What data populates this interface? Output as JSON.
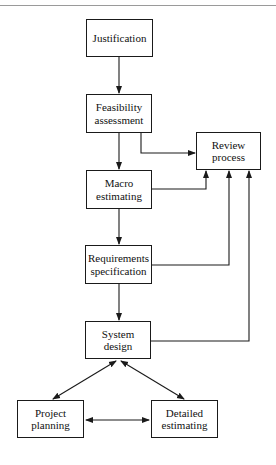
{
  "diagram": {
    "type": "flowchart",
    "nodes": [
      {
        "id": "justification",
        "lines": [
          "Justification"
        ]
      },
      {
        "id": "feasibility",
        "lines": [
          "Feasibility",
          "assessment"
        ]
      },
      {
        "id": "review",
        "lines": [
          "Review",
          "process"
        ]
      },
      {
        "id": "macro",
        "lines": [
          "Macro",
          "estimating"
        ]
      },
      {
        "id": "requirements",
        "lines": [
          "Requirements",
          "specification"
        ]
      },
      {
        "id": "system",
        "lines": [
          "System",
          "design"
        ]
      },
      {
        "id": "project",
        "lines": [
          "Project",
          "planning"
        ]
      },
      {
        "id": "detailed",
        "lines": [
          "Detailed",
          "estimating"
        ]
      }
    ],
    "edges": [
      {
        "from": "justification",
        "to": "feasibility",
        "direction": "forward"
      },
      {
        "from": "feasibility",
        "to": "macro",
        "direction": "forward"
      },
      {
        "from": "feasibility",
        "to": "review",
        "direction": "forward"
      },
      {
        "from": "macro",
        "to": "requirements",
        "direction": "forward"
      },
      {
        "from": "macro",
        "to": "review",
        "direction": "forward"
      },
      {
        "from": "requirements",
        "to": "system",
        "direction": "forward"
      },
      {
        "from": "requirements",
        "to": "review",
        "direction": "forward"
      },
      {
        "from": "system",
        "to": "review",
        "direction": "forward"
      },
      {
        "from": "system",
        "to": "project",
        "direction": "both"
      },
      {
        "from": "system",
        "to": "detailed",
        "direction": "both"
      },
      {
        "from": "project",
        "to": "detailed",
        "direction": "both"
      }
    ]
  }
}
